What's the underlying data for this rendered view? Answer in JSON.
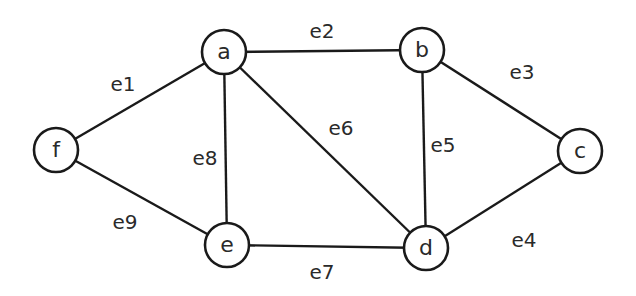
{
  "diagram": {
    "type": "undirected-graph",
    "nodes": [
      {
        "id": "a",
        "label": "a",
        "x": 224,
        "y": 52
      },
      {
        "id": "b",
        "label": "b",
        "x": 422,
        "y": 50
      },
      {
        "id": "c",
        "label": "c",
        "x": 580,
        "y": 151
      },
      {
        "id": "d",
        "label": "d",
        "x": 426,
        "y": 248
      },
      {
        "id": "e",
        "label": "e",
        "x": 227,
        "y": 245
      },
      {
        "id": "f",
        "label": "f",
        "x": 56,
        "y": 150
      }
    ],
    "edges": [
      {
        "id": "e1",
        "label": "e1",
        "from": "f",
        "to": "a",
        "lx": 123,
        "ly": 84
      },
      {
        "id": "e2",
        "label": "e2",
        "from": "a",
        "to": "b",
        "lx": 322,
        "ly": 31
      },
      {
        "id": "e3",
        "label": "e3",
        "from": "b",
        "to": "c",
        "lx": 522,
        "ly": 72
      },
      {
        "id": "e4",
        "label": "e4",
        "from": "d",
        "to": "c",
        "lx": 524,
        "ly": 240
      },
      {
        "id": "e5",
        "label": "e5",
        "from": "b",
        "to": "d",
        "lx": 443,
        "ly": 145
      },
      {
        "id": "e6",
        "label": "e6",
        "from": "a",
        "to": "d",
        "lx": 341,
        "ly": 128
      },
      {
        "id": "e7",
        "label": "e7",
        "from": "e",
        "to": "d",
        "lx": 322,
        "ly": 272
      },
      {
        "id": "e8",
        "label": "e8",
        "from": "a",
        "to": "e",
        "lx": 205,
        "ly": 158
      },
      {
        "id": "e9",
        "label": "e9",
        "from": "f",
        "to": "e",
        "lx": 125,
        "ly": 222
      }
    ],
    "node_radius": 22,
    "colors": {
      "stroke": "#1a1a1a",
      "background": "#ffffff",
      "text": "#2a2a2a"
    }
  }
}
